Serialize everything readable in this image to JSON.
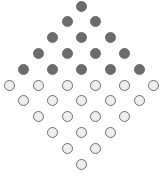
{
  "diagram": {
    "type": "dot-diamond",
    "rows": [
      {
        "count": 1,
        "style": "dark"
      },
      {
        "count": 2,
        "style": "dark"
      },
      {
        "count": 3,
        "style": "dark"
      },
      {
        "count": 4,
        "style": "dark"
      },
      {
        "count": 5,
        "style": "dark"
      },
      {
        "count": 6,
        "style": "light"
      },
      {
        "count": 5,
        "style": "light"
      },
      {
        "count": 4,
        "style": "light"
      },
      {
        "count": 3,
        "style": "light"
      },
      {
        "count": 2,
        "style": "light"
      },
      {
        "count": 1,
        "style": "light"
      }
    ],
    "totals": {
      "dark": 15,
      "light": 21
    },
    "colors": {
      "dark_fill": "#6b6b6b",
      "light_fill": "#eeeeee",
      "stroke": "#6e6e6e"
    }
  }
}
